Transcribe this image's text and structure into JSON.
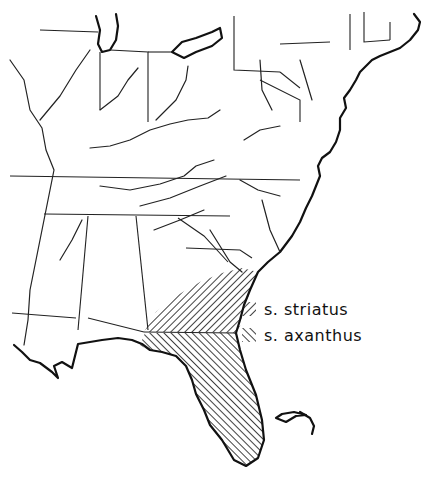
{
  "map": {
    "type": "species range map",
    "region": "Eastern United States",
    "colors": {
      "ink": "#111111",
      "background": "#ffffff"
    }
  },
  "legend": {
    "items": [
      {
        "label": "s. striatus",
        "pattern": "hatch-backslash"
      },
      {
        "label": "s. axanthus",
        "pattern": "hatch-slash"
      }
    ]
  }
}
